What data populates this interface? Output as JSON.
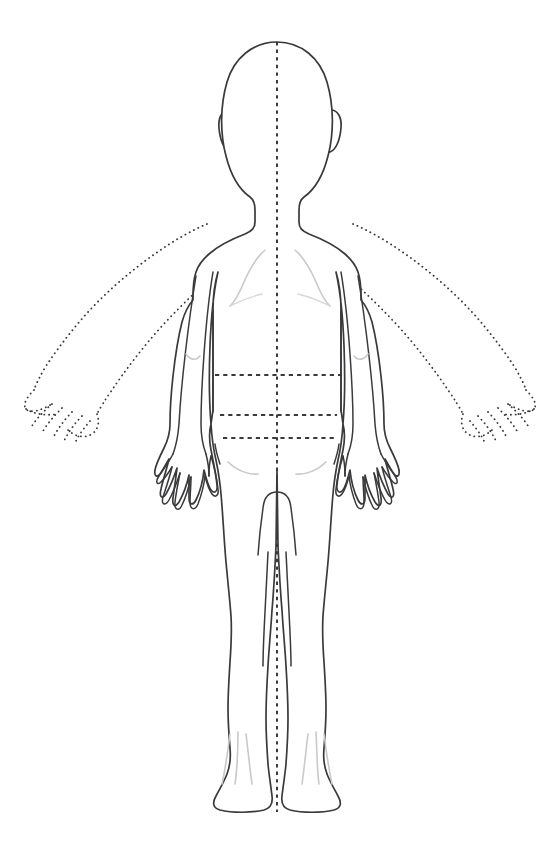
{
  "document": {
    "title": "Body Chart — Posterior View",
    "view": "posterior",
    "subject": "pediatric full body outline",
    "background_color": "#ffffff"
  },
  "colors": {
    "outline": "#3a3a3c",
    "soft_contour": "#c9c9cb",
    "soft_contour_faint": "#d8d8da",
    "midline": "#3a3a3c",
    "reference_line": "#3a3a3c",
    "fill": "#ffffff"
  },
  "canvas": {
    "width": 560,
    "height": 861
  },
  "figure": {
    "regions": [
      {
        "name": "head",
        "label": "Head",
        "style": "solid"
      },
      {
        "name": "ear-left",
        "label": "Left ear",
        "style": "solid"
      },
      {
        "name": "ear-right",
        "label": "Right ear",
        "style": "solid"
      },
      {
        "name": "neck",
        "label": "Neck",
        "style": "solid"
      },
      {
        "name": "torso",
        "label": "Torso",
        "style": "solid"
      },
      {
        "name": "arm-left-down",
        "label": "Left arm (adducted)",
        "style": "solid"
      },
      {
        "name": "arm-right-down",
        "label": "Right arm (adducted)",
        "style": "solid"
      },
      {
        "name": "hand-left-down",
        "label": "Left hand (adducted)",
        "style": "solid"
      },
      {
        "name": "hand-right-down",
        "label": "Right hand (adducted)",
        "style": "solid"
      },
      {
        "name": "arm-left-abducted",
        "label": "Left arm (abducted, dotted)",
        "style": "dotted"
      },
      {
        "name": "arm-right-abducted",
        "label": "Right arm (abducted, dotted)",
        "style": "dotted"
      },
      {
        "name": "hand-left-abducted",
        "label": "Left hand (abducted, dotted)",
        "style": "dotted"
      },
      {
        "name": "hand-right-abducted",
        "label": "Right hand (abducted, dotted)",
        "style": "dotted"
      },
      {
        "name": "leg-left",
        "label": "Left leg",
        "style": "solid"
      },
      {
        "name": "leg-right",
        "label": "Right leg",
        "style": "solid"
      },
      {
        "name": "foot-left",
        "label": "Left foot (heel view)",
        "style": "solid"
      },
      {
        "name": "foot-right",
        "label": "Right foot (heel view)",
        "style": "solid"
      }
    ],
    "soft_contours": [
      {
        "name": "scapula-left",
        "label": "Left scapula contour"
      },
      {
        "name": "scapula-right",
        "label": "Right scapula contour"
      },
      {
        "name": "gluteal-fold-left",
        "label": "Left gluteal fold"
      },
      {
        "name": "gluteal-fold-right",
        "label": "Right gluteal fold"
      },
      {
        "name": "achilles-left",
        "label": "Left Achilles tendon lines"
      },
      {
        "name": "achilles-right",
        "label": "Right Achilles tendon lines"
      },
      {
        "name": "elbow-crease-left",
        "label": "Left elbow crease"
      },
      {
        "name": "elbow-crease-right",
        "label": "Right elbow crease"
      }
    ],
    "guides": {
      "midline": {
        "name": "vertical-midline",
        "label": "Vertical midline",
        "x": 277,
        "y_top": 42,
        "y_bottom": 812,
        "style": "dashed"
      },
      "reference_lines": [
        {
          "name": "reference-line-1",
          "label": "Upper reference line",
          "y": 375,
          "x_start": 215,
          "x_end": 342
        },
        {
          "name": "reference-line-2",
          "label": "Middle reference line",
          "y": 415,
          "x_start": 220,
          "x_end": 337
        },
        {
          "name": "reference-line-3",
          "label": "Lower reference line",
          "y": 438,
          "x_start": 223,
          "x_end": 335
        }
      ]
    }
  }
}
